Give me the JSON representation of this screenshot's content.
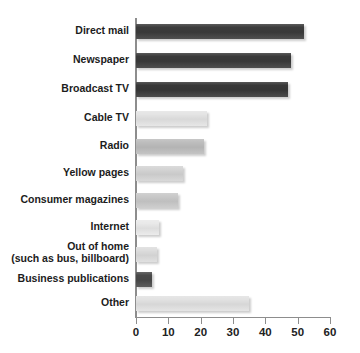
{
  "chart_data": {
    "type": "bar",
    "orientation": "horizontal",
    "title": "",
    "xlabel": "",
    "ylabel": "",
    "xlim": [
      0,
      60
    ],
    "xticks": [
      0,
      10,
      20,
      30,
      40,
      50,
      60
    ],
    "xtick_labels": [
      "0",
      "10",
      "20",
      "30",
      "40",
      "50",
      "60"
    ],
    "grid": false,
    "legend": "none",
    "categories": [
      "Direct mail",
      "Newspaper",
      "Broadcast TV",
      "Cable TV",
      "Radio",
      "Yellow pages",
      "Consumer magazines",
      "Internet",
      "Out of home",
      "Business publications",
      "Other"
    ],
    "values": [
      52,
      48,
      47,
      22,
      21,
      14.5,
      13,
      7,
      6.5,
      5,
      35
    ],
    "bars": [
      {
        "label": "Direct mail",
        "label_line2": "",
        "value": 52,
        "color": "#3c3c3c"
      },
      {
        "label": "Newspaper",
        "label_line2": "",
        "value": 48,
        "color": "#3a3a3a"
      },
      {
        "label": "Broadcast TV",
        "label_line2": "",
        "value": 47,
        "color": "#383838"
      },
      {
        "label": "Cable TV",
        "label_line2": "",
        "value": 22,
        "color": "#e4e4e4"
      },
      {
        "label": "Radio",
        "label_line2": "",
        "value": 21,
        "color": "#bdbdbd"
      },
      {
        "label": "Yellow pages",
        "label_line2": "",
        "value": 14.5,
        "color": "#d4d4d4"
      },
      {
        "label": "Consumer magazines",
        "label_line2": "",
        "value": 13,
        "color": "#c9c9c9"
      },
      {
        "label": "Internet",
        "label_line2": "",
        "value": 7,
        "color": "#e9e9e9"
      },
      {
        "label": "Out of home",
        "label_line2": "(such as bus, billboard)",
        "value": 6.5,
        "color": "#dddddd"
      },
      {
        "label": "Business publications",
        "label_line2": "",
        "value": 5,
        "color": "#4a4a4a"
      },
      {
        "label": "Other",
        "label_line2": "",
        "value": 35,
        "color": "#e2e2e2"
      }
    ],
    "axis_color": "#8d8d8d"
  }
}
